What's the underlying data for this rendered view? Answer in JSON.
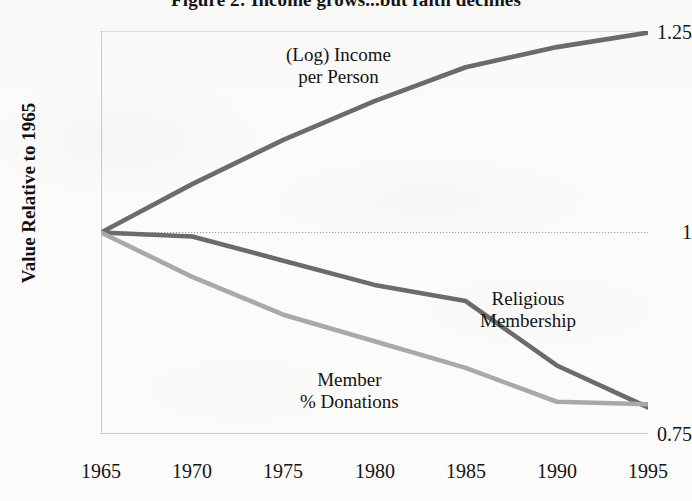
{
  "figure": {
    "title": "Figure 2: Income grows...but faith declines"
  },
  "axes": {
    "y_title": "Value Relative to 1965",
    "y_ticks": [
      "1.25",
      "1",
      "0.75"
    ],
    "x_ticks": [
      "1965",
      "1970",
      "1975",
      "1980",
      "1985",
      "1990",
      "1995"
    ]
  },
  "annotations": {
    "income_line1": "(Log) Income",
    "income_line2": "per Person",
    "membership_line1": "Religious",
    "membership_line2": "Membership",
    "donations_line1": "Member",
    "donations_line2": "% Donations"
  },
  "colors": {
    "income_line": "#6b6b6b",
    "membership_line": "#6b6b6b",
    "donations_line": "#a9a9a9",
    "axis": "#8a8a8a",
    "gridline": "#b9b9b9",
    "text": "#141414",
    "background": "#fbfbfa"
  },
  "chart_data": {
    "type": "line",
    "title": "Figure 2: Income grows...but faith declines",
    "xlabel": "",
    "ylabel": "Value Relative to 1965",
    "x": [
      1965,
      1970,
      1975,
      1980,
      1985,
      1990,
      1995
    ],
    "xlim": [
      1965,
      1995
    ],
    "ylim": [
      0.75,
      1.25
    ],
    "yticks": [
      0.75,
      1.0,
      1.25
    ],
    "grid": "horizontal dotted line at y = 1.00 only",
    "legend": "inline annotations next to each line",
    "series": [
      {
        "name": "(Log) Income per Person",
        "color": "#6b6b6b",
        "values": [
          1.0,
          1.06,
          1.115,
          1.163,
          1.205,
          1.23,
          1.248
        ]
      },
      {
        "name": "Religious Membership",
        "color": "#6b6b6b",
        "values": [
          1.0,
          0.995,
          0.965,
          0.935,
          0.915,
          0.835,
          0.783
        ]
      },
      {
        "name": "Member % Donations",
        "color": "#a9a9a9",
        "values": [
          1.0,
          0.945,
          0.898,
          0.865,
          0.832,
          0.79,
          0.787
        ]
      }
    ]
  }
}
